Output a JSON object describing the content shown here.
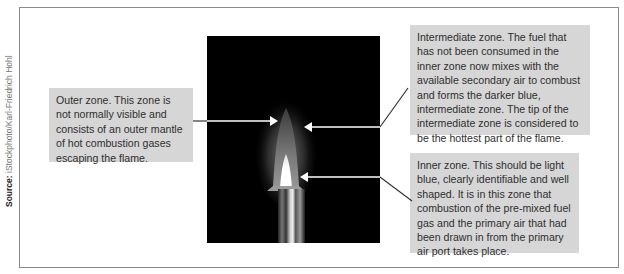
{
  "source": {
    "label": "Source:",
    "credit": "iStockphoto/Karl-Friedrich Hohl"
  },
  "figure": {
    "photo_background": "#000000",
    "callout_background": "#d6d6d6",
    "callouts": [
      {
        "id": "outer-zone",
        "text": "Outer zone. This zone is not normally visible and consists of an outer mantle of hot combustion gases escaping the flame."
      },
      {
        "id": "intermediate-zone",
        "text": "Intermediate zone. The fuel that has not been consumed in the inner zone now mixes with the available secondary air to combust and forms the darker blue, intermediate zone. The tip of the intermediate zone is considered to be the hottest part of the flame."
      },
      {
        "id": "inner-zone",
        "text": "Inner zone. This should be light blue, clearly identifiable and well shaped. It is in this zone that combustion of the pre-mixed fuel gas and the primary air that had been drawn in from the primary air port takes place."
      }
    ]
  }
}
